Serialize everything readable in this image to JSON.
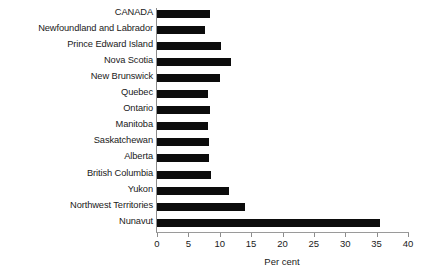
{
  "chart_data": {
    "type": "bar",
    "orientation": "horizontal",
    "title": "",
    "subtitle": "",
    "xlabel": "Per cent",
    "ylabel": "",
    "xlim": [
      0,
      40
    ],
    "xticks": [
      0,
      5,
      10,
      15,
      20,
      25,
      30,
      35,
      40
    ],
    "xtick_labels": [
      "0",
      "5",
      "10",
      "15",
      "20",
      "25",
      "30",
      "35",
      "40"
    ],
    "grid": false,
    "legend": null,
    "bar_color": "#0c0c0c",
    "axis_color": "#8c8c8c",
    "categories": [
      "CANADA",
      "Newfoundland and Labrador",
      "Prince Edward Island",
      "Nova Scotia",
      "New Brunswick",
      "Quebec",
      "Ontario",
      "Manitoba",
      "Saskatchewan",
      "Alberta",
      "British Columbia",
      "Yukon",
      "Northwest Territories",
      "Nunavut"
    ],
    "values": [
      8.4,
      7.7,
      10.2,
      11.8,
      10.0,
      8.2,
      8.4,
      8.1,
      8.3,
      8.3,
      8.6,
      11.5,
      14.0,
      35.6
    ]
  }
}
